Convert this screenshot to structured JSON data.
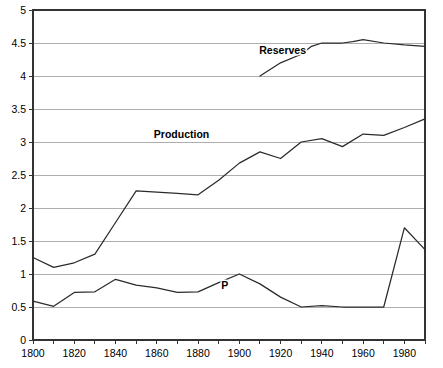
{
  "chart_data": {
    "type": "line",
    "title": "",
    "subtitle": "",
    "xlabel": "",
    "ylabel": "",
    "xlim": [
      1800,
      1990
    ],
    "ylim": [
      0,
      5
    ],
    "grid": true,
    "legend_position": "inline-annotations",
    "y_ticks": [
      "0",
      "0.5",
      "1",
      "1.5",
      "2",
      "2.5",
      "3",
      "3.5",
      "4",
      "4.5",
      "5"
    ],
    "y_tick_values": [
      0,
      0.5,
      1,
      1.5,
      2,
      2.5,
      3,
      3.5,
      4,
      4.5,
      5
    ],
    "x_ticks": [
      "1800",
      "1820",
      "1840",
      "1860",
      "1880",
      "1900",
      "1920",
      "1940",
      "1960",
      "1980"
    ],
    "x_tick_values": [
      1800,
      1820,
      1840,
      1860,
      1880,
      1900,
      1920,
      1940,
      1960,
      1980
    ],
    "x_minor_tick_values": [
      1810,
      1830,
      1850,
      1870,
      1890,
      1910,
      1930,
      1950,
      1970,
      1990
    ],
    "series": [
      {
        "name": "Reserves",
        "label": "Reserves",
        "label_x": 1921,
        "label_y": 4.33,
        "color": "#2b2b2b",
        "x": [
          1910,
          1920,
          1930,
          1935,
          1940,
          1950,
          1955,
          1960,
          1970,
          1980,
          1990
        ],
        "values": [
          4.0,
          4.2,
          4.33,
          4.45,
          4.5,
          4.5,
          4.52,
          4.55,
          4.5,
          4.47,
          4.45
        ]
      },
      {
        "name": "Production",
        "label": "Production",
        "label_x": 1872,
        "label_y": 3.06,
        "color": "#2b2b2b",
        "x": [
          1800,
          1810,
          1820,
          1830,
          1840,
          1850,
          1860,
          1870,
          1880,
          1890,
          1900,
          1910,
          1920,
          1930,
          1940,
          1950,
          1960,
          1970,
          1980,
          1990
        ],
        "values": [
          1.25,
          1.1,
          1.17,
          1.3,
          1.78,
          2.26,
          2.24,
          2.22,
          2.2,
          2.42,
          2.68,
          2.85,
          2.75,
          3.0,
          3.05,
          2.93,
          3.12,
          3.1,
          3.22,
          3.35
        ]
      },
      {
        "name": "P",
        "label": "P",
        "label_x": 1893,
        "label_y": 0.78,
        "color": "#2b2b2b",
        "x": [
          1800,
          1810,
          1820,
          1830,
          1840,
          1850,
          1860,
          1870,
          1880,
          1890,
          1900,
          1910,
          1920,
          1930,
          1940,
          1950,
          1960,
          1970,
          1980,
          1990
        ],
        "values": [
          0.59,
          0.51,
          0.72,
          0.73,
          0.92,
          0.83,
          0.79,
          0.72,
          0.73,
          0.87,
          1.0,
          0.85,
          0.65,
          0.5,
          0.52,
          0.5,
          0.5,
          0.5,
          1.7,
          1.37
        ]
      }
    ]
  },
  "plot_geometry": {
    "left": 33,
    "right": 425,
    "top": 10,
    "bottom": 340
  }
}
